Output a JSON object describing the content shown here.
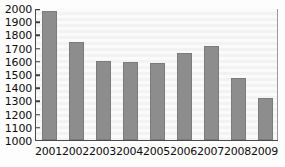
{
  "chart_data": {
    "type": "bar",
    "title": "",
    "subtitle": "",
    "xlabel": "",
    "ylabel": "",
    "categories": [
      "2001",
      "2002",
      "2003",
      "2004",
      "2005",
      "2006",
      "2007",
      "2008",
      "2009"
    ],
    "values": [
      1975,
      1740,
      1595,
      1590,
      1580,
      1660,
      1710,
      1470,
      1320
    ],
    "ylim": [
      1000,
      2000
    ],
    "ytick_step": 100,
    "yticks": [
      1000,
      1100,
      1200,
      1300,
      1400,
      1500,
      1600,
      1700,
      1800,
      1900,
      2000
    ],
    "ytick_labels": [
      "1000",
      "1100",
      "1200",
      "1300",
      "1400",
      "1500",
      "1600",
      "1700",
      "1800",
      "1900",
      "2000"
    ],
    "grid": false,
    "legend": null,
    "legend_position": "none",
    "annotations": [],
    "series": [
      {
        "name": "",
        "values": [
          1975,
          1740,
          1595,
          1590,
          1580,
          1660,
          1710,
          1470,
          1320
        ]
      }
    ],
    "colors": {
      "bar_fill": "#8d8d8d",
      "bar_edge": "#7b7b7b",
      "plot_background": "#f7f7f7",
      "axis_line": "#4a4a4a",
      "tick_label": "#0d0d0d",
      "figure_background": "#fdfdfd"
    }
  }
}
